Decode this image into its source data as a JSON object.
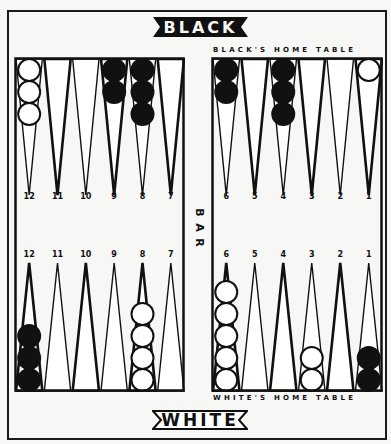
{
  "banners": {
    "top": "BLACK",
    "bottom": "WHITE"
  },
  "labels": {
    "black_home": "BLACK'S HOME TABLE",
    "white_home": "WHITE'S HOME TABLE",
    "bar": [
      "B",
      "A",
      "R"
    ]
  },
  "colors": {
    "background": "#f7f7f5",
    "ink": "#111111",
    "white_checker": "#ffffff",
    "black_checker": "#111111"
  },
  "boards": {
    "top_left": {
      "point_numbers": [
        "12",
        "11",
        "10",
        "9",
        "8",
        "7"
      ],
      "checkers": [
        {
          "color": "white",
          "count": 3
        },
        {
          "color": null,
          "count": 0
        },
        {
          "color": null,
          "count": 0
        },
        {
          "color": "black",
          "count": 2
        },
        {
          "color": "black",
          "count": 3
        },
        {
          "color": null,
          "count": 0
        }
      ]
    },
    "top_right": {
      "point_numbers": [
        "6",
        "5",
        "4",
        "3",
        "2",
        "1"
      ],
      "checkers": [
        {
          "color": "black",
          "count": 2
        },
        {
          "color": null,
          "count": 0
        },
        {
          "color": "black",
          "count": 3
        },
        {
          "color": null,
          "count": 0
        },
        {
          "color": null,
          "count": 0
        },
        {
          "color": "white",
          "count": 1
        }
      ]
    },
    "bottom_left": {
      "point_numbers": [
        "12",
        "11",
        "10",
        "9",
        "8",
        "7"
      ],
      "checkers": [
        {
          "color": "black",
          "count": 3
        },
        {
          "color": null,
          "count": 0
        },
        {
          "color": null,
          "count": 0
        },
        {
          "color": null,
          "count": 0
        },
        {
          "color": "white",
          "count": 4
        },
        {
          "color": null,
          "count": 0
        }
      ]
    },
    "bottom_right": {
      "point_numbers": [
        "6",
        "5",
        "4",
        "3",
        "2",
        "1"
      ],
      "checkers": [
        {
          "color": "white",
          "count": 5
        },
        {
          "color": null,
          "count": 0
        },
        {
          "color": null,
          "count": 0
        },
        {
          "color": "white",
          "count": 2
        },
        {
          "color": null,
          "count": 0
        },
        {
          "color": "black",
          "count": 2
        }
      ]
    }
  }
}
